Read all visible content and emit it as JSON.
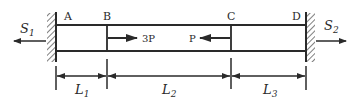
{
  "diagram": {
    "type": "axially loaded bar fixed between two walls",
    "points": [
      {
        "label": "A",
        "x": 56
      },
      {
        "label": "B",
        "x": 107
      },
      {
        "label": "C",
        "x": 231
      },
      {
        "label": "D",
        "x": 306
      }
    ],
    "forces": [
      {
        "label": "3P",
        "at": "B",
        "direction": "right"
      },
      {
        "label": "P",
        "at": "C",
        "direction": "left"
      }
    ],
    "reactions": [
      {
        "label": "S",
        "subscript": "1",
        "at": "A",
        "direction": "left"
      },
      {
        "label": "S",
        "subscript": "2",
        "at": "D",
        "direction": "right"
      }
    ],
    "dimensions": [
      {
        "label": "L",
        "subscript": "1",
        "from": "A",
        "to": "B"
      },
      {
        "label": "L",
        "subscript": "2",
        "from": "B",
        "to": "C"
      },
      {
        "label": "L",
        "subscript": "3",
        "from": "C",
        "to": "D"
      }
    ],
    "colors": {
      "line": "#2a2a2a",
      "background": "#ffffff"
    }
  }
}
